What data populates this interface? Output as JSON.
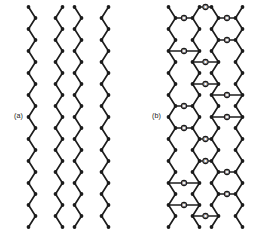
{
  "figure": {
    "background_color": "#ffffff",
    "ink_color": "#1c1c1c",
    "width": 267,
    "height": 234,
    "type": "chemical-structure-diagram"
  },
  "panels": [
    {
      "id": "a",
      "label": "(a)",
      "label_x": 14,
      "label_y": 118,
      "chain_count": 4,
      "chain_x": [
        32,
        59,
        78,
        105
      ],
      "chain_phase": [
        "down",
        "up",
        "down",
        "up"
      ],
      "zigzag": {
        "period": 22,
        "amplitude": 7,
        "vertex_radius": 1.9,
        "top_y": 7,
        "bottom_y": 227
      },
      "oxygen_count": 0
    },
    {
      "id": "b",
      "label": "(b)",
      "label_x": 152,
      "label_y": 118,
      "chain_count": 4,
      "chain_x": [
        172,
        196,
        215,
        239
      ],
      "chain_phase": [
        "down",
        "up",
        "down",
        "up"
      ],
      "zigzag": {
        "period": 22,
        "amplitude": 7,
        "vertex_radius": 1.9,
        "top_y": 7,
        "bottom_y": 227
      },
      "oxygen_label": "O",
      "oxygen_radius": 2.6,
      "oxygen_bridges": [
        {
          "left_chain": 0,
          "right_chain": 1,
          "y": 18
        },
        {
          "left_chain": 0,
          "right_chain": 1,
          "y": 51
        },
        {
          "left_chain": 0,
          "right_chain": 1,
          "y": 106
        },
        {
          "left_chain": 0,
          "right_chain": 1,
          "y": 128
        },
        {
          "left_chain": 0,
          "right_chain": 1,
          "y": 183
        },
        {
          "left_chain": 0,
          "right_chain": 1,
          "y": 205
        },
        {
          "left_chain": 1,
          "right_chain": 2,
          "y": 7
        },
        {
          "left_chain": 1,
          "right_chain": 2,
          "y": 62
        },
        {
          "left_chain": 1,
          "right_chain": 2,
          "y": 84
        },
        {
          "left_chain": 1,
          "right_chain": 2,
          "y": 139
        },
        {
          "left_chain": 1,
          "right_chain": 2,
          "y": 161
        },
        {
          "left_chain": 1,
          "right_chain": 2,
          "y": 216
        },
        {
          "left_chain": 2,
          "right_chain": 3,
          "y": 18
        },
        {
          "left_chain": 2,
          "right_chain": 3,
          "y": 40
        },
        {
          "left_chain": 2,
          "right_chain": 3,
          "y": 95
        },
        {
          "left_chain": 2,
          "right_chain": 3,
          "y": 117
        },
        {
          "left_chain": 2,
          "right_chain": 3,
          "y": 172
        },
        {
          "left_chain": 2,
          "right_chain": 3,
          "y": 194
        }
      ]
    }
  ],
  "caption": {
    "partial_text": ""
  }
}
